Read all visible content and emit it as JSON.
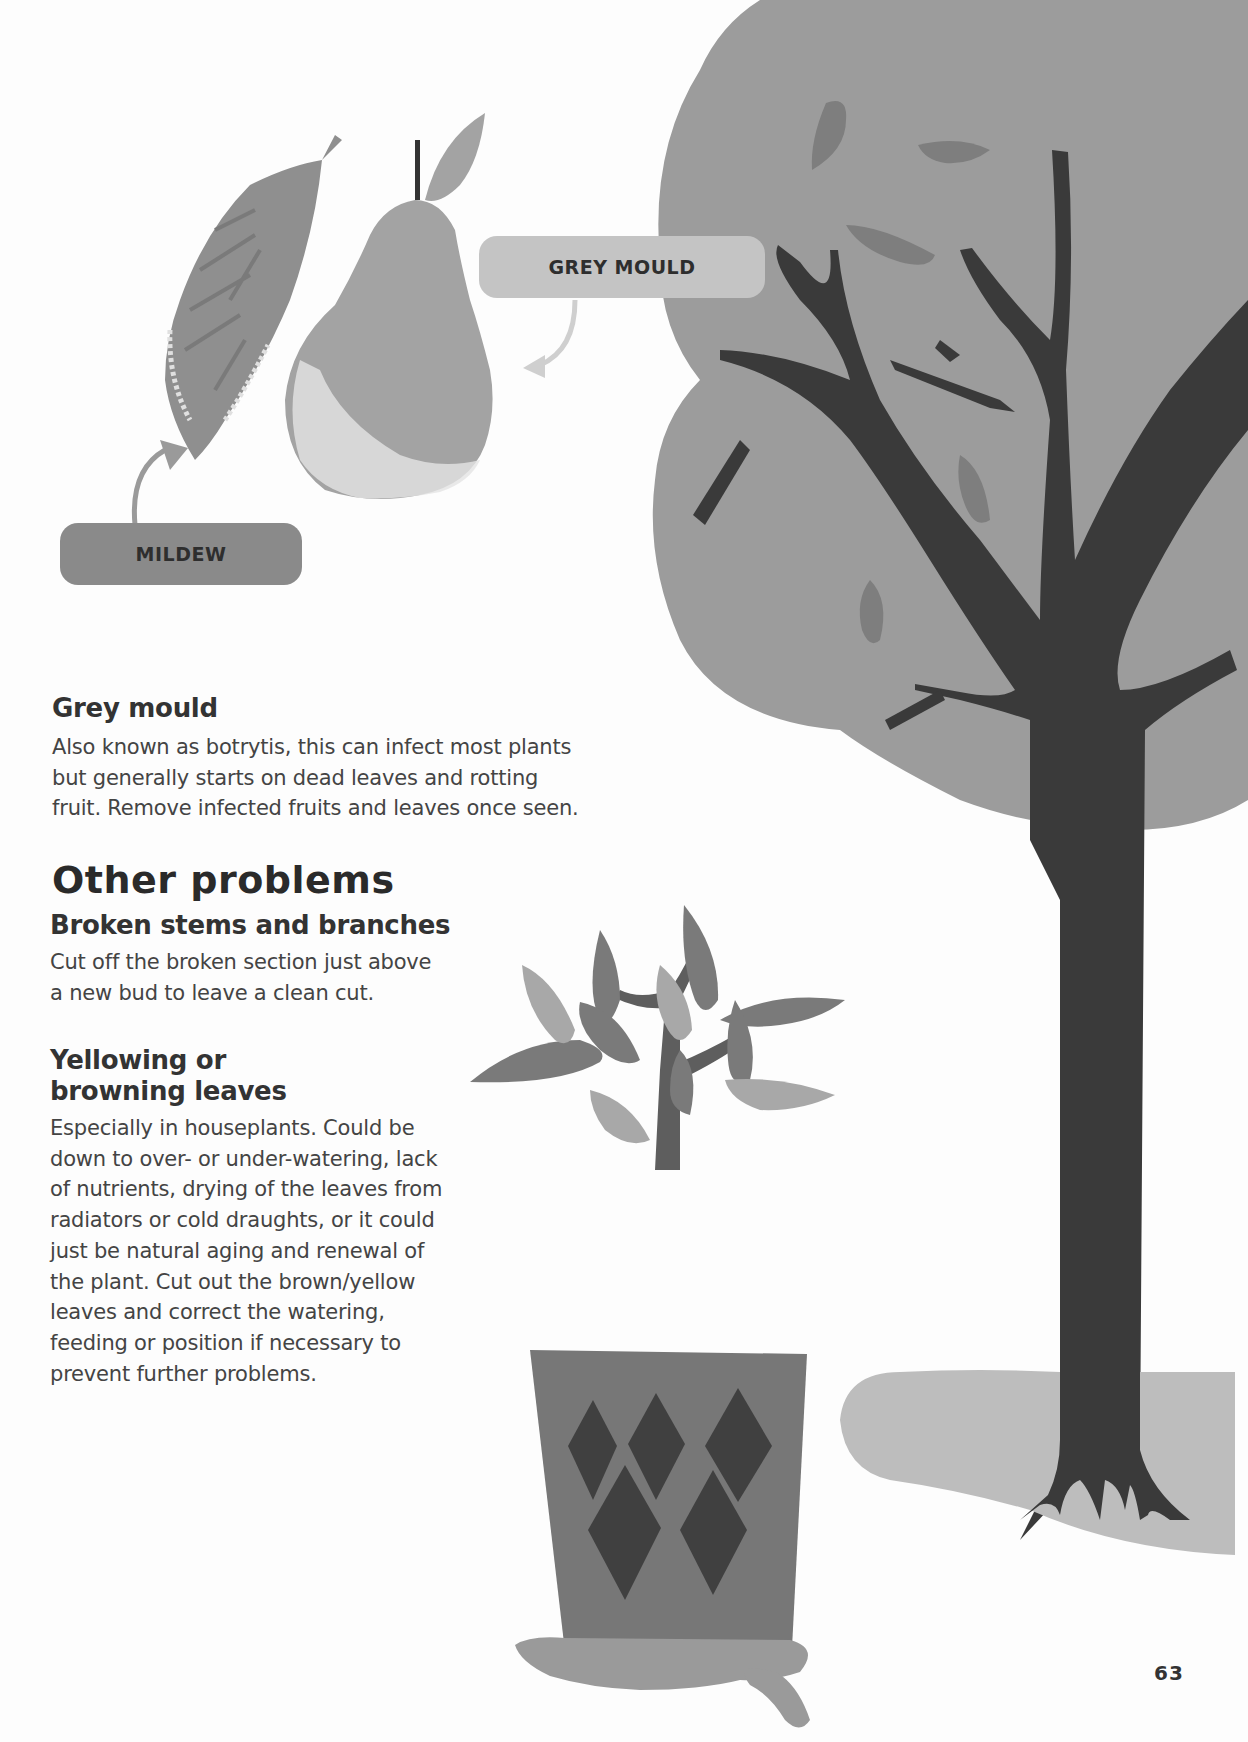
{
  "labels": {
    "grey_mould": "GREY MOULD",
    "mildew": "MILDEW"
  },
  "sections": {
    "grey_mould": {
      "heading": "Grey mould",
      "body_lines": [
        "Also known as botrytis, this can infect most plants",
        "but generally starts on dead leaves and rotting",
        "fruit. Remove infected fruits and leaves once seen."
      ]
    },
    "other_problems": {
      "heading": "Other problems"
    },
    "broken_stems": {
      "heading": "Broken stems and branches",
      "body_lines": [
        "Cut off the broken section just above",
        "a new bud to leave a clean cut."
      ]
    },
    "yellowing": {
      "heading_lines": [
        "Yellowing or",
        "browning leaves"
      ],
      "body_lines": [
        "Especially in houseplants. Could be",
        "down to over- or under-watering, lack",
        "of nutrients, drying of the leaves from",
        "radiators or cold draughts, or it could",
        "just be natural aging and renewal of",
        "the plant. Cut out the brown/yellow",
        "leaves and correct the watering,",
        "feeding or position if necessary to",
        "prevent further problems."
      ]
    }
  },
  "page_number": "63",
  "colors": {
    "tree_canopy": "#9c9c9c",
    "tree_trunk": "#3a3a3a",
    "canopy_leaves": "#7e7e7e",
    "ground": "#bdbdbd",
    "pot": "#777777",
    "pot_diamonds": "#404040",
    "plant_leaf_dark": "#7a7a7a",
    "plant_leaf_light": "#a8a8a8",
    "puddle": "#9a9a9a",
    "pear": "#a3a3a3",
    "mildew_leaf": "#8f8f8f"
  }
}
